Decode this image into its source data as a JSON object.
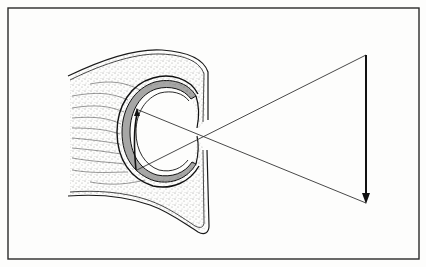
{
  "diagram": {
    "type": "optics-eye-image-formation",
    "description": "Line drawing of an eye (cross-section with stippled tissue, retina and opening) forming an inverted image of an external object via crossing light rays",
    "colors": {
      "background": "#fdfdfc",
      "ink": "#1a1a1a",
      "frame": "#2a2a2a"
    },
    "frame": {
      "x": 8,
      "y": 8,
      "width": 411,
      "height": 251
    },
    "object_arrow": {
      "x": 366,
      "y_top": 55,
      "y_bottom": 203,
      "direction": "down"
    },
    "image_arrow": {
      "x_top": 137,
      "y_top": 109,
      "x_bottom": 136,
      "y_bottom": 170,
      "direction": "up"
    },
    "focal_point": {
      "x": 194,
      "y": 130
    },
    "rays": [
      {
        "from": [
          366,
          55
        ],
        "through": [
          194,
          130
        ],
        "to": [
          137,
          170
        ]
      },
      {
        "from": [
          366,
          203
        ],
        "through": [
          194,
          130
        ],
        "to": [
          136,
          109
        ]
      }
    ],
    "labels": []
  }
}
